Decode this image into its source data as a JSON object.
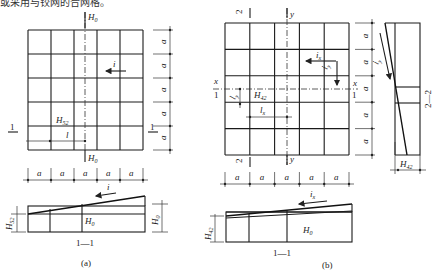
{
  "header": {
    "truncated_text": "或采用与铰网的合网格。"
  },
  "figure_a": {
    "caption": "(a)",
    "grid": {
      "cols": 5,
      "rows": 5
    },
    "labels": {
      "h_center": "H",
      "h_center_sub": "0",
      "h_center_bottom": "H",
      "h_center_bottom_sub": "0",
      "slope": "i",
      "h_point": "H",
      "h_point_sub": "52",
      "length": "l",
      "section_mark": "1",
      "dim_a": "a"
    },
    "right_dims": [
      "a",
      "a",
      "a",
      "a",
      "a"
    ],
    "bottom_dims": [
      "a",
      "a",
      "a",
      "a",
      "a"
    ],
    "section": {
      "title": "1—1",
      "slope": "i",
      "h_left": "H",
      "h_left_sub": "52",
      "h_mid": "H",
      "h_mid_sub": "0",
      "h_right": "H",
      "h_right_sub": "0"
    }
  },
  "figure_b": {
    "caption": "(b)",
    "grid": {
      "cols": 5,
      "rows": 5
    },
    "labels": {
      "axis_y": "y",
      "axis_x": "x",
      "section_2": "2",
      "section_1": "1",
      "slope_x": "i",
      "slope_x_sub": "x",
      "slope_y": "i",
      "slope_y_sub": "y",
      "h_point": "H",
      "h_point_sub": "42",
      "len_x": "l",
      "len_x_sub": "x",
      "len_y": "l",
      "len_y_sub": "y"
    },
    "right_dims": [
      "a",
      "a",
      "a",
      "a",
      "a"
    ],
    "bottom_dims": [
      "a",
      "a",
      "a",
      "a",
      "a"
    ],
    "section_2_2": {
      "title": "2—2",
      "slope": "i",
      "slope_sub": "y",
      "h_bottom": "H",
      "h_bottom_sub": "42"
    },
    "section_1_1": {
      "title": "1—1",
      "slope": "i",
      "slope_sub": "x",
      "h_left": "H",
      "h_left_sub": "42",
      "h_mid": "H",
      "h_mid_sub": "0"
    }
  }
}
